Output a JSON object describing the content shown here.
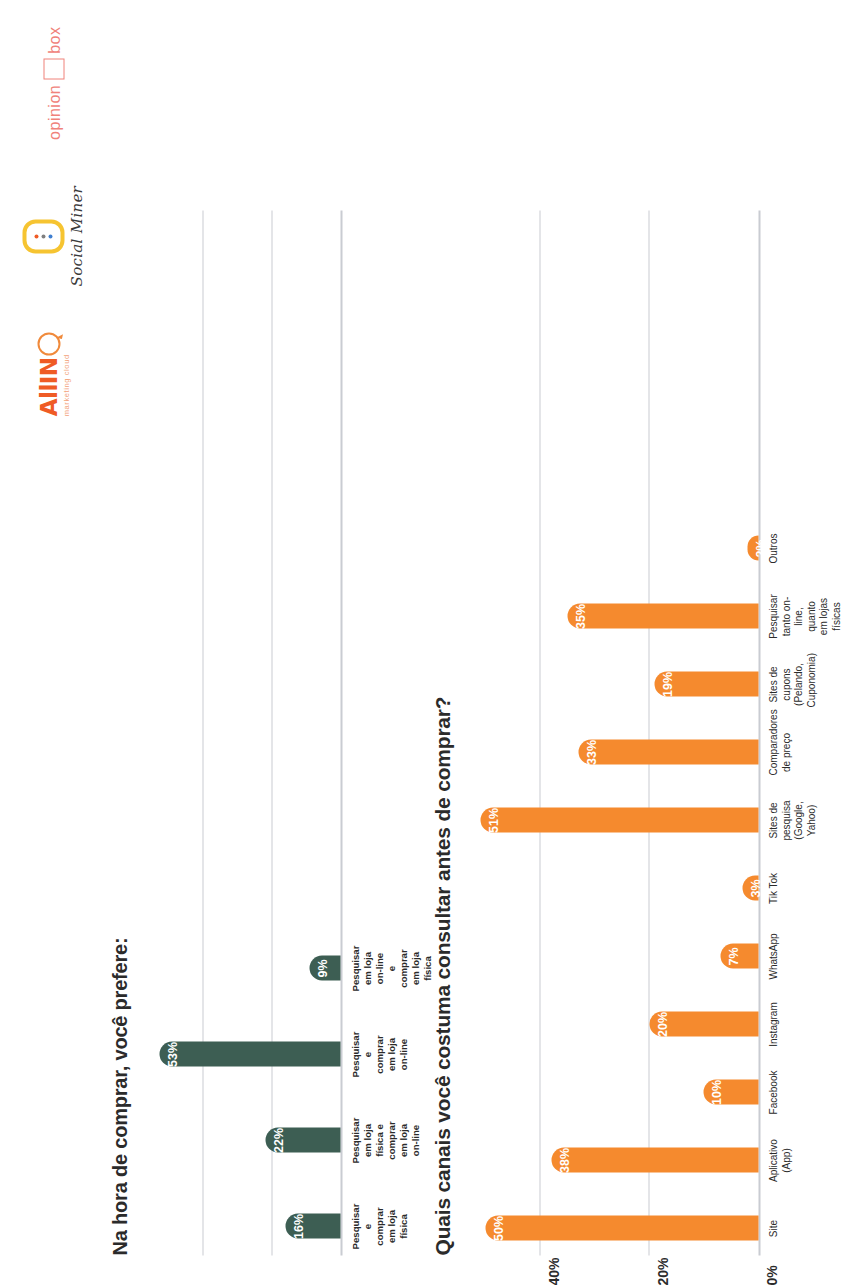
{
  "logos": {
    "allin": {
      "word": "AllIN",
      "tagline": "marketing cloud",
      "mark": "speech-bubble-icon"
    },
    "social_miner": {
      "word": "Social Miner",
      "mark": "three-dots-capsule-icon"
    },
    "opinion_box": {
      "word": "opinion",
      "suffix": "box",
      "mark": "square-outline-icon"
    }
  },
  "chart_data": [
    {
      "id": "preference",
      "type": "bar",
      "title": "Na hora de comprar, você prefere:",
      "orientation": "vertical",
      "grid": true,
      "ylim": [
        0,
        60
      ],
      "ylabel": "",
      "xlabel": "",
      "legend": "none",
      "color": "#3d5e53",
      "gridlines": [
        20,
        40
      ],
      "categories": [
        "Pesquisar e comprar\nem loja física",
        "Pesquisar em loja física e\ncomprar em loja on-line",
        "Pesquisar e comprar\nem loja on-line",
        "Pesquisar em loja on-line\ne comprar em loja física"
      ],
      "values": [
        16,
        22,
        53,
        9
      ],
      "value_labels": [
        "16%",
        "22%",
        "53%",
        "9%"
      ]
    },
    {
      "id": "channels",
      "type": "bar",
      "title": "Quais canais você costuma consultar antes de comprar?",
      "orientation": "vertical",
      "grid": true,
      "ylim": [
        0,
        55
      ],
      "ylabel": "",
      "xlabel": "",
      "legend": "none",
      "color": "#f58a2e",
      "gridlines": [
        20,
        40
      ],
      "yticks": [
        "0%",
        "20%",
        "40%"
      ],
      "ytick_values": [
        0,
        20,
        40
      ],
      "categories": [
        "Site",
        "Aplicativo (App)",
        "Facebook",
        "Instagram",
        "WhatsApp",
        "Tik Tok",
        "Sites de pesquisa\n(Google, Yahoo)",
        "Comparadores de preço",
        "Sites de cupons\n(Pelando, Cuponomia)",
        "Pesquisar tanto on-line,\nquanto em lojas físicas",
        "Outros"
      ],
      "values": [
        50,
        38,
        10,
        20,
        7,
        3,
        51,
        33,
        19,
        35,
        2
      ],
      "value_labels": [
        "50%",
        "38%",
        "10%",
        "20%",
        "7%",
        "3%",
        "51%",
        "33%",
        "19%",
        "35%",
        "2%"
      ]
    }
  ]
}
